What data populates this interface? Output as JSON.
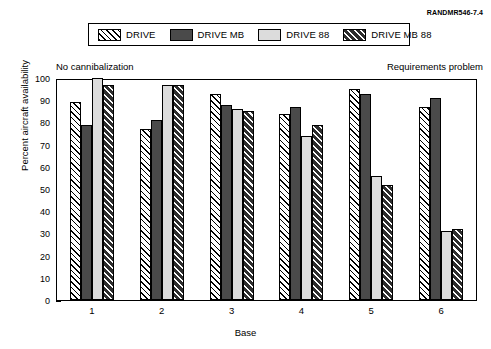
{
  "source_credit": "RANDMR546-7.4",
  "annotations": {
    "left": "No cannibalization",
    "right": "Requirements problem"
  },
  "legend": {
    "entries": [
      {
        "label": "DRIVE",
        "swatch": "diagonal-hatch-on-white"
      },
      {
        "label": "DRIVE MB",
        "swatch": "solid-dark-gray"
      },
      {
        "label": "DRIVE 88",
        "swatch": "solid-light-gray"
      },
      {
        "label": "DRIVE MB 88",
        "swatch": "white-diagonal-hatch-on-dark"
      }
    ]
  },
  "chart_data": {
    "type": "bar",
    "title": "",
    "xlabel": "Base",
    "ylabel": "Percent aircraft availability",
    "categories": [
      "1",
      "2",
      "3",
      "4",
      "5",
      "6"
    ],
    "yticks": [
      0,
      10,
      20,
      30,
      40,
      50,
      60,
      70,
      80,
      90,
      100
    ],
    "ylim": [
      0,
      100
    ],
    "grid": false,
    "legend_position": "top",
    "series": [
      {
        "name": "DRIVE",
        "values": [
          89,
          77,
          93,
          84,
          95,
          87
        ]
      },
      {
        "name": "DRIVE MB",
        "values": [
          79,
          81,
          88,
          87,
          93,
          91
        ]
      },
      {
        "name": "DRIVE 88",
        "values": [
          100,
          97,
          86,
          74,
          56,
          31
        ]
      },
      {
        "name": "DRIVE MB 88",
        "values": [
          97,
          97,
          85,
          79,
          52,
          32
        ]
      }
    ]
  }
}
